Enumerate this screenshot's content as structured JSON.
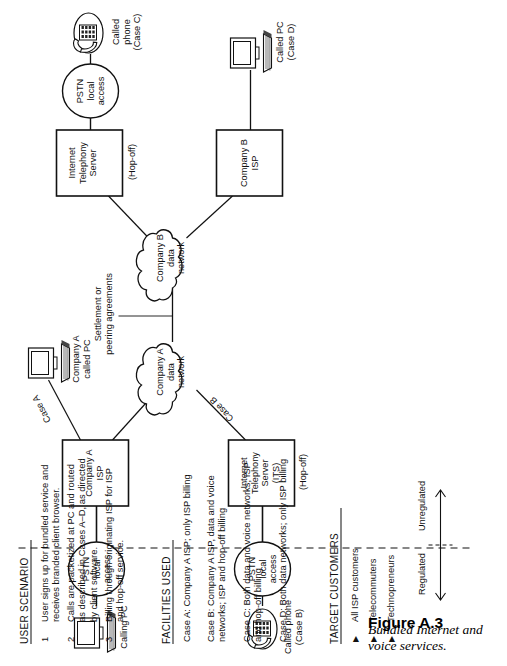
{
  "figure": {
    "number": "Figure A.3",
    "caption": "Bundled Internet and voice services."
  },
  "diagram": {
    "nodes": {
      "calling_pc": "Calling PC",
      "called_phone_b": "Called phone\n(Case B)",
      "pstn_1": "PSTN\nlocal\naccess",
      "pstn_2": "PSTN\nlocal\naccess",
      "pstn_3": "PSTN\nlocal\naccess",
      "company_a_isp": "Company A\nISP",
      "its_left": "Internet\nTelephony\nServer\n(ITS)",
      "its_left_hopoff": "(Hop-off)",
      "company_a_data_network": "Company A\ndata\nnetwork",
      "company_b_data_network": "Company B\ndata\nnetwork",
      "company_a_called_pc": "Company A\ncalled PC",
      "company_b_isp": "Company B\nISP",
      "its_top": "Internet\nTelephony\nServer",
      "its_top_hopoff": "(Hop-off)",
      "called_phone_c": "Called\nphone\n(Case C)",
      "called_pc_d": "Called PC\n(Case D)"
    },
    "edge_labels": {
      "case_a": "Case A",
      "case_b": "Case B",
      "settlement": "Settlement or\npeering agreements"
    },
    "axis": {
      "regulated": "Regulated",
      "unregulated": "Unregulated"
    }
  },
  "user_scenario": {
    "title": "USER SCENARIO",
    "items": [
      {
        "num": "1",
        "text": "User signs up for bundled service and\nreceives branded client browser."
      },
      {
        "num": "2",
        "text": "Calls are packetized at PC and routed\nas described in Cases A–D, as directed\nby client software."
      },
      {
        "num": "3",
        "text": "Billing through originating ISP for ISP\nand hop-off service."
      }
    ]
  },
  "facilities_used": {
    "title": "FACILITIES USED",
    "items": [
      "Case A: Company A ISP; only ISP billing",
      "Case B: Company A ISP, data and voice\n            networks; ISP and hop-off billing",
      "Case C: Both data and voice networks; ISP\n            and hop-off billing",
      "Case D: Both data networks; only ISP billing"
    ]
  },
  "target_customers": {
    "title": "TARGET CUSTOMERS",
    "bullet_glyph": "▶",
    "items": [
      "All ISP customers",
      "Telecommuters",
      "Technopreneurs"
    ]
  }
}
